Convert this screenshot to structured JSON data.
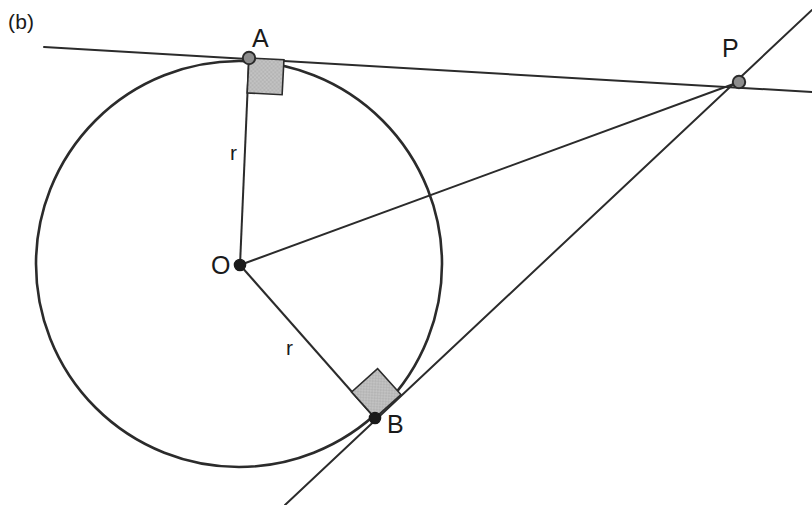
{
  "figure": {
    "panel_tag": "(b)",
    "width": 812,
    "height": 505,
    "background_color": "#ffffff",
    "stroke_color": "#2b2b2b",
    "marker_fill_color": "#b5b5b5",
    "marker_stroke_color": "#2b2b2b",
    "point_fill_color": "#1a1a1a",
    "point_hollow_fill_color": "#8d8d8d"
  },
  "labels": {
    "point_a": "A",
    "point_b": "B",
    "point_o": "O",
    "point_p": "P",
    "radius_oa": "r",
    "radius_ob": "r"
  },
  "geometry": {
    "circle": {
      "cx": 239,
      "cy": 264,
      "r": 203
    },
    "points": {
      "A": {
        "x": 249,
        "y": 58,
        "style": "hollow"
      },
      "B": {
        "x": 375,
        "y": 418,
        "style": "filled"
      },
      "O": {
        "x": 240,
        "y": 265,
        "style": "filled"
      },
      "P": {
        "x": 739,
        "y": 82,
        "style": "hollow"
      }
    },
    "segments": [
      {
        "name": "radius-OA",
        "from": "O",
        "to": "A"
      },
      {
        "name": "radius-OB",
        "from": "O",
        "to": "B"
      },
      {
        "name": "hypotenuse-OP",
        "from": "O",
        "to": "P"
      }
    ],
    "tangent_lines": [
      {
        "name": "tangent-at-A",
        "x1": 44,
        "y1": 47,
        "x2": 812,
        "y2": 92,
        "touch": "A"
      },
      {
        "name": "tangent-at-B",
        "x1": 285,
        "y1": 505,
        "x2": 812,
        "y2": 10,
        "touch": "B"
      }
    ],
    "right_angle_markers": [
      {
        "name": "right-angle-at-A",
        "vertex": "A",
        "size": 35,
        "rotation_deg": 3
      },
      {
        "name": "right-angle-at-B",
        "vertex": "B",
        "size": 35,
        "rotation_deg": -44
      }
    ],
    "label_positions": {
      "panel_tag": {
        "x": 8,
        "y": 11
      },
      "A": {
        "x": 252,
        "y": 26
      },
      "B": {
        "x": 387,
        "y": 412
      },
      "O": {
        "x": 211,
        "y": 253
      },
      "P": {
        "x": 722,
        "y": 36
      },
      "radius_oa": {
        "x": 230,
        "y": 142
      },
      "radius_ob": {
        "x": 286,
        "y": 337
      }
    }
  }
}
